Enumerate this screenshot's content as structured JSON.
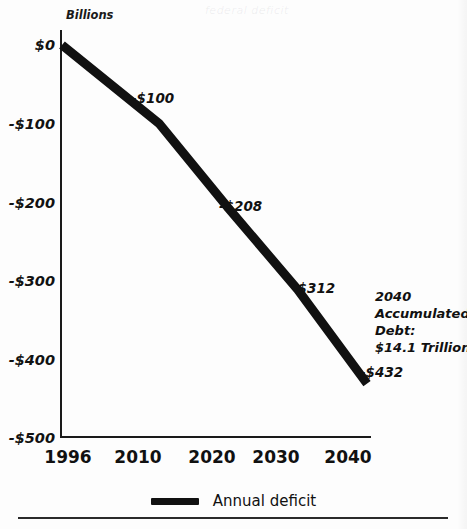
{
  "page": {
    "background_color": "#fdfdfd",
    "ghost_text": "federal deficit"
  },
  "chart_data": {
    "type": "line",
    "title": "",
    "subtitle": "",
    "units_label": "Billions",
    "xlabel": "",
    "ylabel": "",
    "x": [
      1996,
      2010,
      2020,
      2030,
      2040
    ],
    "categories": [
      "1996",
      "2010",
      "2020",
      "2030",
      "2040"
    ],
    "series": [
      {
        "name": "Annual deficit",
        "color": "#111111",
        "values": [
          0,
          -100,
          -208,
          -312,
          -432
        ]
      }
    ],
    "point_labels": [
      "",
      "-$100",
      "-$208",
      "-$312",
      "-$432"
    ],
    "xlim": [
      1996,
      2040
    ],
    "ylim": [
      -500,
      0
    ],
    "ytick_values": [
      0,
      -100,
      -200,
      -300,
      -400,
      -500
    ],
    "ytick_labels": [
      "$0",
      "-$100",
      "-$200",
      "-$300",
      "-$400",
      "-$500"
    ],
    "xtick_labels": [
      "1996",
      "2010",
      "2020",
      "2030",
      "2040"
    ],
    "grid": false,
    "legend_position": "bottom-center",
    "annotations": [
      {
        "name": "accumulated-debt-note",
        "lines": [
          "2040",
          "Accumulated",
          "Debt:",
          "$14.1 Trillion"
        ]
      }
    ]
  },
  "axes": {
    "y_ticks": [
      {
        "label": "$0",
        "value": 0
      },
      {
        "label": "-$100",
        "value": -100
      },
      {
        "label": "-$200",
        "value": -200
      },
      {
        "label": "-$300",
        "value": -300
      },
      {
        "label": "-$400",
        "value": -400
      },
      {
        "label": "-$500",
        "value": -500
      }
    ],
    "x_ticks": [
      {
        "label": "1996",
        "value": 1996
      },
      {
        "label": "2010",
        "value": 2010
      },
      {
        "label": "2020",
        "value": 2020
      },
      {
        "label": "2030",
        "value": 2030
      },
      {
        "label": "2040",
        "value": 2040
      }
    ]
  },
  "units": {
    "label": "Billions"
  },
  "point_values": {
    "p1996": "",
    "p2010": "-$100",
    "p2020": "-$208",
    "p2030": "-$312",
    "p2040": "-$432"
  },
  "annotation": {
    "line1": "2040",
    "line2": "Accumulated",
    "line3": "Debt:",
    "line4": "$14.1 Trillion"
  },
  "legend": {
    "items": [
      {
        "label": "Annual deficit",
        "color": "#111111"
      }
    ],
    "label": "Annual deficit"
  }
}
